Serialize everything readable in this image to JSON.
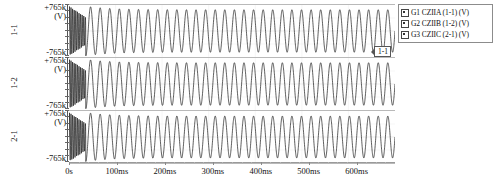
{
  "chart_data": {
    "type": "line",
    "title": "",
    "xlabel": "",
    "ylabel": "(V)",
    "grid": false,
    "legend_position": "right",
    "xlim": [
      0,
      0.68
    ],
    "x_tick_labels": [
      "0s",
      "100ms",
      "200ms",
      "300ms",
      "400ms",
      "500ms",
      "600ms"
    ],
    "x_tick_values": [
      0,
      0.1,
      0.2,
      0.3,
      0.4,
      0.5,
      0.6
    ],
    "panels": [
      {
        "id": "1-1",
        "trace_label": "1-1",
        "y_max_label": "+765k",
        "y_min_label": "-765k",
        "y_unit": "(V)",
        "ylim": [
          -765000,
          765000
        ],
        "callout": "1-1",
        "series_name": "G1 CZIIA (1-1) (V)",
        "waveform": {
          "shape": "damped-transient-then-steady-sine",
          "frequency_hz": 50,
          "steady_amplitude": 650000,
          "transient_peak": 760000,
          "transient_duration_s": 0.035
        }
      },
      {
        "id": "1-2",
        "trace_label": "1-2",
        "y_max_label": "+765k",
        "y_min_label": "-765k",
        "y_unit": "(V)",
        "ylim": [
          -765000,
          765000
        ],
        "callout": "1-2",
        "series_name": "G2 CZIIB (1-2) (V)",
        "waveform": {
          "shape": "damped-transient-then-steady-sine",
          "frequency_hz": 50,
          "steady_amplitude": 650000,
          "transient_peak": 755000,
          "transient_duration_s": 0.035
        }
      },
      {
        "id": "2-1",
        "trace_label": "2-1",
        "y_max_label": "+765k",
        "y_min_label": "-765k",
        "y_unit": "(V)",
        "ylim": [
          -765000,
          765000
        ],
        "callout": "2-1",
        "series_name": "G3 CZIIC (2-1) (V)",
        "waveform": {
          "shape": "damped-transient-then-steady-sine",
          "frequency_hz": 50,
          "steady_amplitude": 640000,
          "transient_peak": 750000,
          "transient_duration_s": 0.035
        }
      }
    ],
    "series": [
      {
        "name": "G1 CZIIA (1-1) (V)",
        "panel": "1-1",
        "color": "#000000"
      },
      {
        "name": "G2 CZIIB (1-2) (V)",
        "panel": "1-2",
        "color": "#000000"
      },
      {
        "name": "G3 CZIIC (2-1) (V)",
        "panel": "2-1",
        "color": "#000000"
      }
    ]
  },
  "legend": {
    "items": [
      {
        "checked": true,
        "label": "G1 CZIIA (1-1) (V)"
      },
      {
        "checked": true,
        "label": "G2 CZIIB (1-2) (V)"
      },
      {
        "checked": true,
        "label": "G3 CZIIC (2-1) (V)"
      }
    ]
  },
  "colors": {
    "trace": "#1a1a1a",
    "axis": "#8a8a8a",
    "frame": "#b9b9b9",
    "legend_border": "#8c8c8c",
    "background": "#ffffff"
  }
}
